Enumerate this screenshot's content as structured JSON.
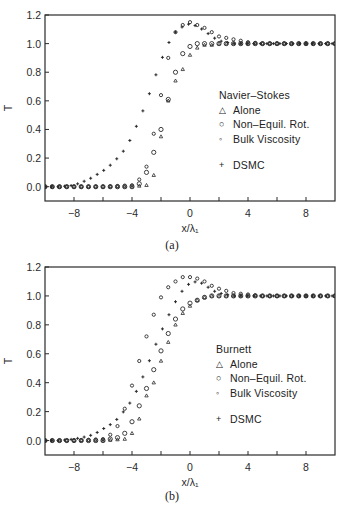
{
  "figure": {
    "panels": [
      {
        "id": "a",
        "caption": "(a)",
        "legend_title": "Navier–Stokes"
      },
      {
        "id": "b",
        "caption": "(b)",
        "legend_title": "Burnett"
      }
    ],
    "legend_items": [
      {
        "symbol": "△",
        "icon": "triangle-icon",
        "label": "Alone"
      },
      {
        "symbol": "○",
        "icon": "large-circle-icon",
        "label": "Non–Equil. Rot."
      },
      {
        "symbol": "◦",
        "icon": "small-circle-icon",
        "label": "Bulk Viscosity"
      },
      {
        "symbol": "+",
        "icon": "plus-icon",
        "label": "DSMC"
      }
    ],
    "xlabel": "x/λ₁",
    "ylabel": "T"
  },
  "chart_data": [
    {
      "type": "scatter",
      "title": "(a) Navier–Stokes",
      "xlabel": "x/λ1",
      "ylabel": "T",
      "xlim": [
        -10,
        10
      ],
      "ylim": [
        -0.1,
        1.2
      ],
      "xticks": [
        -8,
        -4,
        0,
        4,
        8
      ],
      "yticks": [
        0.0,
        0.2,
        0.4,
        0.6,
        0.8,
        1.0,
        1.2
      ],
      "grid": false,
      "legend_position": "center-right",
      "series": [
        {
          "name": "Alone",
          "marker": "triangle",
          "x": [
            -10,
            -8,
            -6,
            -4,
            -3,
            -2.5,
            -2,
            -1.5,
            -1,
            -0.5,
            0,
            0.5,
            1,
            1.5,
            2,
            3,
            4,
            6,
            8,
            10
          ],
          "y": [
            0,
            0,
            0,
            0,
            0.01,
            0.08,
            0.35,
            0.6,
            0.74,
            0.82,
            0.92,
            0.97,
            0.99,
            0.99,
            1.0,
            1.0,
            1.0,
            1.0,
            1.0,
            1.0
          ]
        },
        {
          "name": "Non-Equil. Rot.",
          "marker": "large-circle",
          "x": [
            -10,
            -8,
            -6,
            -4,
            -3.5,
            -3,
            -2.5,
            -2,
            -1.5,
            -1,
            -0.5,
            0,
            0.5,
            1,
            1.5,
            2,
            3,
            4,
            6,
            8,
            10
          ],
          "y": [
            0,
            0,
            0,
            0,
            0.02,
            0.1,
            0.24,
            0.4,
            0.61,
            0.8,
            0.93,
            0.98,
            1.0,
            1.0,
            1.0,
            1.0,
            1.0,
            1.0,
            1.0,
            1.0,
            1.0
          ]
        },
        {
          "name": "Bulk Viscosity",
          "marker": "small-circle",
          "x": [
            -10,
            -8,
            -6,
            -4,
            -3.5,
            -3,
            -2.5,
            -2,
            -1.5,
            -1,
            -0.5,
            0,
            0.5,
            1,
            1.5,
            2,
            3,
            4,
            5,
            6,
            8,
            10
          ],
          "y": [
            0,
            0,
            0,
            0.01,
            0.05,
            0.14,
            0.37,
            0.64,
            0.9,
            1.08,
            1.13,
            1.15,
            1.13,
            1.11,
            1.08,
            1.05,
            1.03,
            1.01,
            1.0,
            1.0,
            1.0,
            1.0
          ]
        },
        {
          "name": "DSMC",
          "marker": "plus",
          "x": [
            -10,
            -9,
            -8,
            -7.5,
            -7,
            -6.5,
            -6,
            -5.5,
            -5,
            -4.5,
            -4,
            -3.5,
            -3,
            -2.5,
            -2,
            -1.5,
            -1,
            -0.5,
            0,
            0.5,
            1,
            1.5,
            2,
            3,
            4,
            6,
            8,
            10
          ],
          "y": [
            0,
            0,
            0.01,
            0.03,
            0.05,
            0.08,
            0.11,
            0.15,
            0.2,
            0.26,
            0.35,
            0.47,
            0.59,
            0.74,
            0.88,
            1.0,
            1.08,
            1.12,
            1.14,
            1.12,
            1.09,
            1.05,
            1.02,
            1.0,
            1.0,
            1.0,
            1.0,
            1.0
          ]
        }
      ]
    },
    {
      "type": "scatter",
      "title": "(b) Burnett",
      "xlabel": "x/λ1",
      "ylabel": "T",
      "xlim": [
        -10,
        10
      ],
      "ylim": [
        -0.1,
        1.2
      ],
      "xticks": [
        -8,
        -4,
        0,
        4,
        8
      ],
      "yticks": [
        0.0,
        0.2,
        0.4,
        0.6,
        0.8,
        1.0,
        1.2
      ],
      "grid": false,
      "legend_position": "center-right",
      "series": [
        {
          "name": "Alone",
          "marker": "triangle",
          "x": [
            -10,
            -8,
            -6,
            -4.5,
            -4,
            -3.5,
            -3,
            -2.5,
            -2,
            -1.5,
            -1,
            -0.5,
            0,
            0.5,
            1,
            1.5,
            2,
            3,
            4,
            6,
            8,
            10
          ],
          "y": [
            0,
            0,
            0,
            0.01,
            0.05,
            0.15,
            0.31,
            0.4,
            0.55,
            0.68,
            0.8,
            0.88,
            0.93,
            0.97,
            0.99,
            1.0,
            1.0,
            1.0,
            1.0,
            1.0,
            1.0,
            1.0
          ]
        },
        {
          "name": "Non-Equil. Rot.",
          "marker": "large-circle",
          "x": [
            -10,
            -8,
            -6,
            -5,
            -4.5,
            -4,
            -3.5,
            -3,
            -2.5,
            -2,
            -1.5,
            -1,
            -0.5,
            0,
            0.5,
            1,
            1.5,
            2,
            3,
            4,
            6,
            8,
            10
          ],
          "y": [
            0,
            0,
            0,
            0.02,
            0.05,
            0.13,
            0.24,
            0.36,
            0.49,
            0.62,
            0.74,
            0.84,
            0.91,
            0.95,
            0.97,
            0.99,
            1.0,
            1.0,
            1.0,
            1.0,
            1.0,
            1.0,
            1.0
          ]
        },
        {
          "name": "Bulk Viscosity",
          "marker": "small-circle",
          "x": [
            -10,
            -8,
            -6,
            -5.5,
            -5,
            -4.5,
            -4,
            -3.5,
            -3,
            -2.5,
            -2,
            -1.5,
            -1,
            -0.5,
            0,
            0.5,
            1,
            1.5,
            2,
            3,
            4,
            5,
            6,
            8,
            10
          ],
          "y": [
            0,
            0,
            0.01,
            0.04,
            0.1,
            0.22,
            0.38,
            0.55,
            0.72,
            0.87,
            0.99,
            1.06,
            1.1,
            1.13,
            1.13,
            1.12,
            1.1,
            1.07,
            1.05,
            1.02,
            1.01,
            1.0,
            1.0,
            1.0,
            1.0
          ]
        },
        {
          "name": "DSMC",
          "marker": "plus",
          "x": [
            -10,
            -9,
            -8,
            -7.5,
            -7,
            -6.5,
            -6,
            -5.5,
            -5,
            -4.5,
            -4,
            -3.5,
            -3,
            -2.5,
            -2,
            -1.5,
            -1,
            -0.5,
            0,
            0.5,
            1,
            1.5,
            2,
            3,
            4,
            6,
            8,
            10
          ],
          "y": [
            0,
            0,
            0.01,
            0.02,
            0.03,
            0.05,
            0.08,
            0.11,
            0.15,
            0.21,
            0.28,
            0.38,
            0.5,
            0.63,
            0.75,
            0.86,
            0.96,
            1.04,
            1.09,
            1.1,
            1.08,
            1.04,
            1.02,
            1.0,
            1.0,
            1.0,
            1.0,
            1.0
          ]
        }
      ]
    }
  ]
}
